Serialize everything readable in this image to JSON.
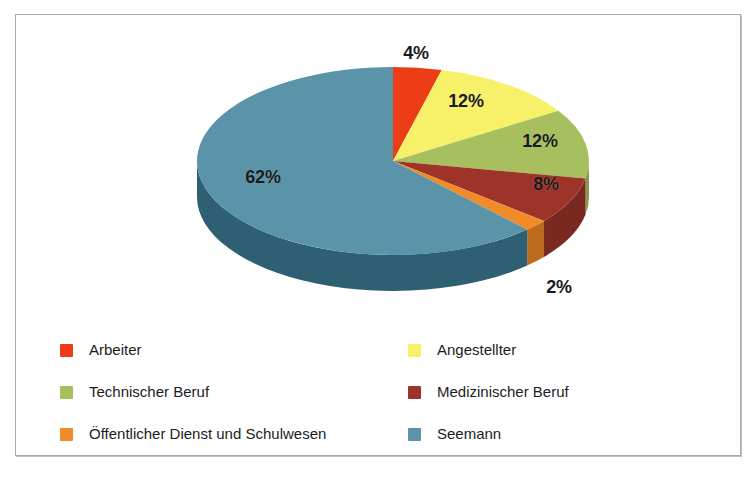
{
  "chart_data": {
    "type": "pie",
    "title": "",
    "subtitle": "",
    "xlabel": "",
    "ylabel": "",
    "grid": false,
    "legend_position": "bottom",
    "value_suffix": "%",
    "start_angle_deg": 0,
    "direction": "clockwise",
    "three_d": true,
    "categories": [
      "Arbeiter",
      "Angestellter",
      "Technischer Beruf",
      "Medizinischer Beruf",
      "Öffentlicher Dienst und Schulwesen",
      "Seemann"
    ],
    "values": [
      4,
      12,
      12,
      8,
      2,
      62
    ],
    "labels": [
      "4%",
      "12%",
      "12%",
      "8%",
      "2%",
      "62%"
    ],
    "colors": [
      "#ec3d16",
      "#f7f069",
      "#a8bf60",
      "#9e3429",
      "#f08b28",
      "#5b93a8"
    ],
    "side_colors": [
      "#b32f10",
      "#c7c154",
      "#87994d",
      "#7a2820",
      "#bd6c1d",
      "#2f5f72"
    ]
  },
  "card": {
    "border_color": "#a9a9a9",
    "background": "#ffffff"
  },
  "pie": {
    "slices": [
      {
        "key": "arbeiter",
        "label": "4%",
        "value": 4,
        "color": "#ec3d16",
        "side_color": "#b32f10",
        "label_x": 400,
        "label_y": 24
      },
      {
        "key": "angestellter",
        "label": "12%",
        "value": 12,
        "color": "#f7f069",
        "side_color": "#c7c154",
        "label_x": 447,
        "label_y": 86
      },
      {
        "key": "technischer",
        "label": "12%",
        "value": 12,
        "color": "#a8bf60",
        "side_color": "#87994d",
        "label_x": 522,
        "label_y": 126
      },
      {
        "key": "medizinischer",
        "label": "8%",
        "value": 8,
        "color": "#9e3429",
        "side_color": "#7a2820",
        "label_x": 529,
        "label_y": 168
      },
      {
        "key": "oeffentlich",
        "label": "2%",
        "value": 2,
        "color": "#f08b28",
        "side_color": "#bd6c1d",
        "label_x": 541,
        "label_y": 272
      },
      {
        "key": "seemann",
        "label": "62%",
        "value": 62,
        "color": "#5b93a8",
        "side_color": "#2f5f72",
        "label_x": 245,
        "label_y": 162
      }
    ]
  },
  "legend": {
    "rows": [
      [
        {
          "key": "arbeiter",
          "label": "Arbeiter",
          "color": "#ec3d16"
        },
        {
          "key": "angestellter",
          "label": "Angestellter",
          "color": "#f7f069"
        }
      ],
      [
        {
          "key": "technischer",
          "label": "Technischer Beruf",
          "color": "#a8bf60"
        },
        {
          "key": "medizinischer",
          "label": "Medizinischer Beruf",
          "color": "#9e3429"
        }
      ],
      [
        {
          "key": "oeffentlich",
          "label": "Öffentlicher Dienst und Schulwesen",
          "color": "#f08b28"
        },
        {
          "key": "seemann",
          "label": "Seemann",
          "color": "#5b93a8"
        }
      ]
    ]
  }
}
